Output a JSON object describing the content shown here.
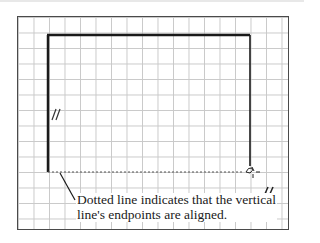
{
  "diagram": {
    "type": "cad-sketch-constraint-illustration",
    "grid": {
      "visible": true,
      "color": "#c9c9c9"
    },
    "sketch": {
      "left_vertical_line": {
        "x": 48,
        "y1": 35,
        "y2": 172
      },
      "top_horizontal_line": {
        "y": 35,
        "x1": 48,
        "x2": 250
      },
      "right_vertical_line": {
        "x": 250,
        "y1": 35,
        "y2": 172
      },
      "alignment_dotted_line": {
        "y": 172,
        "x1": 48,
        "x2": 250
      }
    },
    "constraint_symbols": [
      {
        "name": "parallel-symbol-left",
        "glyph": "//",
        "x": 55,
        "y": 113
      },
      {
        "name": "parallel-symbol-right",
        "glyph": "//",
        "x": 265,
        "y": 190
      }
    ],
    "cursor": {
      "glyph": "pen-cursor-with-crosshair",
      "x": 250,
      "y": 170
    },
    "callout": {
      "line1": "Dotted line indicates that the vertical",
      "line2": "line's endpoints are aligned."
    },
    "colors": {
      "stroke": "#1a1a1a",
      "frame": "#4a4a4a",
      "text": "#1a1a1a"
    }
  }
}
